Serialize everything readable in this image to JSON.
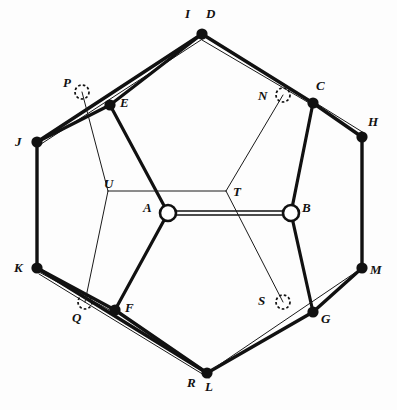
{
  "figure": {
    "type": "geometric-diagram",
    "canvas": {
      "width": 397,
      "height": 410
    },
    "colors": {
      "background": "#fdfdfd",
      "stroke": "#111111",
      "thin_stroke": "#2a2a2a",
      "node_fill": "#111111",
      "open_node_fill": "#ffffff"
    },
    "nodes": [
      {
        "id": "A",
        "label": "A",
        "x": 168,
        "y": 213,
        "style": "open-circle",
        "label_dx": -20,
        "label_dy": -6
      },
      {
        "id": "B",
        "label": "B",
        "x": 291,
        "y": 213,
        "style": "open-circle",
        "label_dx": 11,
        "label_dy": -6
      },
      {
        "id": "C",
        "label": "C",
        "x": 313,
        "y": 103,
        "style": "filled-dot",
        "label_dx": 6,
        "label_dy": -20
      },
      {
        "id": "D",
        "label": "D",
        "x": 202,
        "y": 34,
        "style": "filled-dot",
        "label_dx": 6,
        "label_dy": -24
      },
      {
        "id": "E",
        "label": "E",
        "x": 110,
        "y": 105,
        "style": "filled-dot",
        "label_dx": 10,
        "label_dy": -4
      },
      {
        "id": "F",
        "label": "F",
        "x": 115,
        "y": 310,
        "style": "filled-dot",
        "label_dx": 10,
        "label_dy": -3
      },
      {
        "id": "G",
        "label": "G",
        "x": 313,
        "y": 312,
        "style": "filled-dot",
        "label_dx": 8,
        "label_dy": 5
      },
      {
        "id": "H",
        "label": "H",
        "x": 362,
        "y": 137,
        "style": "filled-dot",
        "label_dx": 7,
        "label_dy": -20
      },
      {
        "id": "I",
        "label": "I",
        "x": 188,
        "y": 30,
        "style": "label-only",
        "label_dx": -2,
        "label_dy": -24
      },
      {
        "id": "J",
        "label": "J",
        "x": 37,
        "y": 142,
        "style": "filled-dot",
        "label_dx": -20,
        "label_dy": 0
      },
      {
        "id": "K",
        "label": "K",
        "x": 37,
        "y": 268,
        "style": "filled-dot",
        "label_dx": -20,
        "label_dy": 0
      },
      {
        "id": "L",
        "label": "L",
        "x": 207,
        "y": 373,
        "style": "filled-dot",
        "label_dx": 1,
        "label_dy": 13
      },
      {
        "id": "M",
        "label": "M",
        "x": 362,
        "y": 268,
        "style": "filled-dot",
        "label_dx": 8,
        "label_dy": 2
      },
      {
        "id": "N",
        "label": "N",
        "x": 283,
        "y": 95,
        "style": "dashed-circle",
        "label_dx": -23,
        "label_dy": 1
      },
      {
        "id": "P",
        "label": "P",
        "x": 82,
        "y": 92,
        "style": "dashed-circle",
        "label_dx": -17,
        "label_dy": -9
      },
      {
        "id": "Q",
        "label": "Q",
        "x": 85,
        "y": 302,
        "style": "dashed-circle",
        "label_dx": -11,
        "label_dy": 16
      },
      {
        "id": "R",
        "label": "R",
        "x": 192,
        "y": 369,
        "style": "label-only",
        "label_dx": -2,
        "label_dy": 12
      },
      {
        "id": "S",
        "label": "S",
        "x": 283,
        "y": 302,
        "style": "dashed-circle",
        "label_dx": -23,
        "label_dy": -2
      },
      {
        "id": "T",
        "label": "T",
        "x": 226,
        "y": 191,
        "style": "junction",
        "label_dx": 7,
        "label_dy": 1
      },
      {
        "id": "U",
        "label": "U",
        "x": 108,
        "y": 191,
        "style": "junction",
        "label_dx": -4,
        "label_dy": -9
      }
    ],
    "thick_edges": [
      {
        "from": "J",
        "to": "D",
        "name": "edge-J-D"
      },
      {
        "from": "D",
        "to": "C",
        "name": "edge-D-C"
      },
      {
        "from": "C",
        "to": "H",
        "name": "edge-C-H"
      },
      {
        "from": "H",
        "to": "M",
        "name": "edge-H-M"
      },
      {
        "from": "M",
        "to": "G",
        "name": "edge-M-G"
      },
      {
        "from": "G",
        "to": "L",
        "name": "edge-G-L"
      },
      {
        "from": "L",
        "to": "F",
        "name": "edge-L-F"
      },
      {
        "from": "F",
        "to": "K",
        "name": "edge-F-K"
      },
      {
        "from": "K",
        "to": "J",
        "name": "edge-K-J"
      },
      {
        "from": "J",
        "to": "E",
        "name": "edge-J-E"
      },
      {
        "from": "E",
        "to": "A",
        "name": "edge-E-A"
      },
      {
        "from": "A",
        "to": "B",
        "name": "edge-A-B"
      },
      {
        "from": "A",
        "to": "F",
        "name": "edge-A-F"
      },
      {
        "from": "B",
        "to": "C",
        "name": "edge-B-C"
      },
      {
        "from": "B",
        "to": "G",
        "name": "edge-B-G"
      },
      {
        "from": "D",
        "to": "E",
        "name": "edge-D-E"
      },
      {
        "from": "K",
        "to": "L",
        "name": "edge-K-L"
      }
    ],
    "thin_edges": [
      {
        "from": "P",
        "to": "U",
        "name": "thin-P-U"
      },
      {
        "from": "U",
        "to": "Q",
        "name": "thin-U-Q"
      },
      {
        "from": "U",
        "to": "T",
        "name": "thin-U-T"
      },
      {
        "from": "N",
        "to": "T",
        "name": "thin-N-T"
      },
      {
        "from": "T",
        "to": "S",
        "name": "thin-T-S"
      },
      {
        "from": "L",
        "to": "M",
        "name": "thin-L-M"
      },
      {
        "from": "J",
        "to": "P",
        "name": "thin-J-P-rail"
      },
      {
        "from": "D",
        "to": "C",
        "name": "thin-D-C-rail"
      },
      {
        "from": "C",
        "to": "H",
        "name": "thin-C-H-rail"
      },
      {
        "from": "K",
        "to": "L",
        "name": "thin-K-L-rail"
      }
    ],
    "open_nodes": [
      "A",
      "B"
    ],
    "dashed_nodes": [
      "N",
      "P",
      "Q",
      "S"
    ],
    "junction_nodes": [
      "T",
      "U"
    ],
    "label_only_nodes": [
      "I",
      "R"
    ]
  }
}
